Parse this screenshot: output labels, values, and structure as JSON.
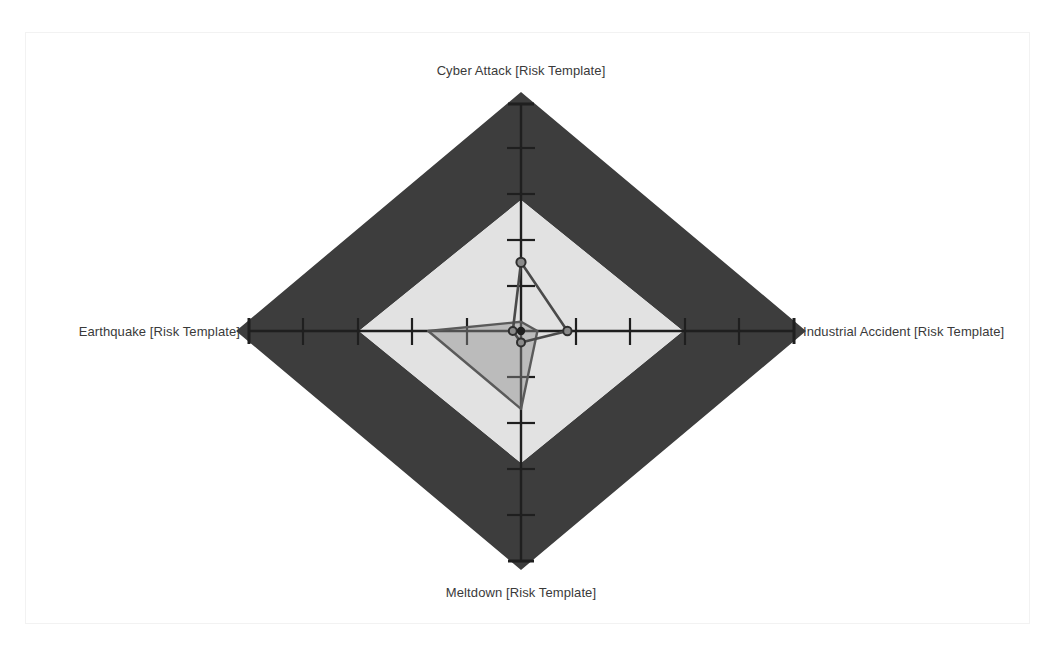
{
  "chart_data": {
    "type": "radar",
    "title": "",
    "axes": [
      {
        "key": "top",
        "label": "Cyber Attack [Risk Template]",
        "angle_deg": 90,
        "max": 5,
        "ticks": 5
      },
      {
        "key": "right",
        "label": "Industrial Accident [Risk Template]",
        "angle_deg": 0,
        "max": 5,
        "ticks": 5
      },
      {
        "key": "bottom",
        "label": "Meltdown [Risk Template]",
        "angle_deg": 270,
        "max": 5,
        "ticks": 5
      },
      {
        "key": "left",
        "label": "Earthquake [Risk Template]",
        "angle_deg": 180,
        "max": 5,
        "ticks": 5
      }
    ],
    "categories": [
      "Cyber Attack [Risk Template]",
      "Industrial Accident [Risk Template]",
      "Meltdown [Risk Template]",
      "Earthquake [Risk Template]"
    ],
    "rlim": [
      0,
      5
    ],
    "grid": false,
    "legend": "none",
    "series": [
      {
        "name": "series-1",
        "values": [
          1.5,
          0.85,
          0.25,
          0.15
        ],
        "line_color": "#4a4a4a",
        "fill_color": "rgba(150,150,150,0.0)",
        "markers": true
      },
      {
        "name": "series-2",
        "values": [
          0.2,
          0.3,
          1.7,
          1.7
        ],
        "line_color": "#5a5a5a",
        "fill_color": "rgba(140,140,140,0.45)",
        "markers": false
      }
    ],
    "bands": [
      {
        "name": "inner-band",
        "from": 0,
        "to": 3,
        "color": "#e2e2e2"
      },
      {
        "name": "outer-band",
        "from": 3,
        "to": 5.1,
        "color": "#3d3d3d"
      }
    ],
    "axis_color": "#1f1f1f",
    "label_color": "#3a3a3a",
    "background": "#ffffff",
    "frame_color": "#f2f2f2"
  },
  "labels": {
    "top": "Cyber Attack [Risk Template]",
    "right": "Industrial Accident [Risk Template]",
    "bottom": "Meltdown [Risk Template]",
    "left": "Earthquake [Risk Template]"
  }
}
